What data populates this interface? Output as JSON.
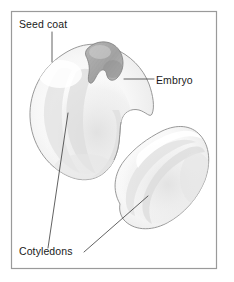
{
  "figure": {
    "background_color": "#ffffff",
    "frame": {
      "name": "diagram-border",
      "x": 11,
      "y": 11,
      "width": 206,
      "height": 258,
      "stroke_color": "#9a9a9a"
    }
  },
  "labels": [
    {
      "id": "seed-coat",
      "text": "Seed coat",
      "x": 19,
      "y": 28,
      "anchor": "start"
    },
    {
      "id": "embryo",
      "text": "Embryo",
      "x": 156,
      "y": 84,
      "anchor": "start"
    },
    {
      "id": "cotyledons",
      "text": "Cotyledons",
      "x": 19,
      "y": 255,
      "anchor": "start"
    }
  ],
  "leaders": [
    {
      "id": "seed-coat-leader",
      "path": "M 52 32 L 52 62"
    },
    {
      "id": "embryo-leader",
      "path": "M 124 79 L 154 79"
    },
    {
      "id": "cotyledons-leader-left",
      "path": "M 68 113 L 48 248"
    },
    {
      "id": "cotyledons-leader-right",
      "path": "M 84 252 L 148 196"
    }
  ],
  "shapes": {
    "seed_upper": {
      "name": "seed-upper-left",
      "description": "large bean seed, upper left, with embryo notch",
      "fill_color": "#fafafa",
      "stroke_color": "#8d8d8d"
    },
    "seed_lower": {
      "name": "seed-lower-right",
      "description": "bean seed, lower right, tilted kidney shape",
      "fill_color": "#fbfbfb",
      "stroke_color": "#8d8d8d"
    },
    "embryo_body": {
      "name": "embryo-shape",
      "description": "darker hatched wedge representing the embryo",
      "fill_color": "#a9a9a9",
      "stroke_color": "#7d7d7d"
    }
  },
  "colors": {
    "ink": "#1a1a1a",
    "leader": "#3a3a3a",
    "outline": "#8d8d8d",
    "frame": "#9a9a9a",
    "seed_fill": "#fafafa",
    "embryo_fill": "#a9a9a9",
    "shade_light": "#ededed",
    "shade_mid": "#e2e2e2"
  }
}
